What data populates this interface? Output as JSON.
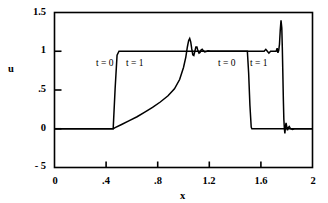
{
  "chart_data": {
    "type": "line",
    "title": "",
    "xlabel": "x",
    "ylabel": "u",
    "xlim": [
      0,
      2
    ],
    "ylim": [
      -0.5,
      1.5
    ],
    "grid": false,
    "legend": "none",
    "xticks": [
      {
        "value": 0,
        "label": "0"
      },
      {
        "value": 0.4,
        "label": ".4"
      },
      {
        "value": 0.8,
        "label": ".8"
      },
      {
        "value": 1.2,
        "label": "1.2"
      },
      {
        "value": 1.6,
        "label": "1.6"
      },
      {
        "value": 2.0,
        "label": "2"
      }
    ],
    "yticks": [
      {
        "value": 1.5,
        "label": "1.5"
      },
      {
        "value": 1.0,
        "label": "1"
      },
      {
        "value": 0.5,
        "label": ".5"
      },
      {
        "value": 0.0,
        "label": "0"
      },
      {
        "value": -0.5,
        "label": "- 5"
      }
    ],
    "annotations": [
      {
        "text": "t = 0",
        "x": 0.57,
        "y": 0.64
      },
      {
        "text": "t = 1",
        "x": 0.8,
        "y": 0.64
      },
      {
        "text": "t = 0",
        "x": 1.36,
        "y": 0.64
      },
      {
        "text": "t = 1",
        "x": 1.6,
        "y": 0.64
      }
    ],
    "series": [
      {
        "name": "t = 0 (initial square pulse)",
        "color": "#000000",
        "points": [
          [
            0.0,
            0.0
          ],
          [
            0.455,
            0.0
          ],
          [
            0.47,
            0.52
          ],
          [
            0.485,
            0.95
          ],
          [
            0.5,
            1.0
          ],
          [
            1.495,
            1.0
          ],
          [
            1.505,
            0.72
          ],
          [
            1.515,
            0.3
          ],
          [
            1.525,
            0.02
          ],
          [
            1.53,
            0.0
          ],
          [
            2.0,
            0.0
          ]
        ]
      },
      {
        "name": "t = 1 (numerical solution)",
        "color": "#000000",
        "points": [
          [
            0.0,
            0.0
          ],
          [
            0.455,
            0.0
          ],
          [
            0.47,
            0.015
          ],
          [
            0.52,
            0.055
          ],
          [
            0.58,
            0.105
          ],
          [
            0.64,
            0.155
          ],
          [
            0.7,
            0.215
          ],
          [
            0.76,
            0.275
          ],
          [
            0.82,
            0.345
          ],
          [
            0.88,
            0.425
          ],
          [
            0.93,
            0.515
          ],
          [
            0.97,
            0.635
          ],
          [
            1.0,
            0.79
          ],
          [
            1.018,
            0.925
          ],
          [
            1.03,
            1.055
          ],
          [
            1.04,
            1.14
          ],
          [
            1.048,
            1.165
          ],
          [
            1.056,
            1.12
          ],
          [
            1.064,
            1.03
          ],
          [
            1.072,
            0.955
          ],
          [
            1.08,
            0.945
          ],
          [
            1.088,
            1.0
          ],
          [
            1.096,
            1.055
          ],
          [
            1.104,
            1.055
          ],
          [
            1.112,
            1.005
          ],
          [
            1.12,
            0.975
          ],
          [
            1.128,
            0.985
          ],
          [
            1.136,
            1.015
          ],
          [
            1.145,
            1.025
          ],
          [
            1.155,
            1.005
          ],
          [
            1.165,
            0.99
          ],
          [
            1.175,
            0.995
          ],
          [
            1.19,
            1.005
          ],
          [
            1.21,
            1.0
          ],
          [
            1.3,
            1.0
          ],
          [
            1.45,
            1.0
          ],
          [
            1.55,
            1.0
          ],
          [
            1.6,
            1.0
          ],
          [
            1.625,
            1.0
          ],
          [
            1.638,
            1.025
          ],
          [
            1.65,
            1.0
          ],
          [
            1.662,
            0.975
          ],
          [
            1.675,
            1.0
          ],
          [
            1.7,
            1.0
          ],
          [
            1.718,
            1.0
          ],
          [
            1.726,
            1.04
          ],
          [
            1.732,
            0.98
          ],
          [
            1.738,
            1.01
          ],
          [
            1.744,
            1.09
          ],
          [
            1.75,
            1.27
          ],
          [
            1.756,
            1.4
          ],
          [
            1.762,
            1.3
          ],
          [
            1.766,
            1.05
          ],
          [
            1.77,
            0.72
          ],
          [
            1.774,
            0.38
          ],
          [
            1.778,
            0.12
          ],
          [
            1.782,
            0.0
          ],
          [
            1.786,
            -0.06
          ],
          [
            1.79,
            0.02
          ],
          [
            1.795,
            0.075
          ],
          [
            1.8,
            0.03
          ],
          [
            1.806,
            -0.02
          ],
          [
            1.812,
            0.015
          ],
          [
            1.82,
            0.03
          ],
          [
            1.83,
            0.0
          ],
          [
            1.845,
            -0.01
          ],
          [
            1.86,
            0.0
          ],
          [
            1.9,
            0.0
          ],
          [
            2.0,
            0.0
          ]
        ]
      }
    ]
  },
  "axes": {
    "ylabel": "u",
    "xlabel": "x"
  }
}
